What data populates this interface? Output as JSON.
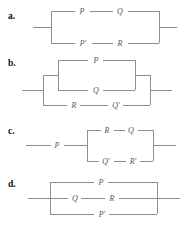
{
  "figure": {
    "line_color": "#8b8f94",
    "label_color": "#55585c",
    "marker_color": "#111111",
    "background": "#ffffff"
  },
  "panels": [
    {
      "marker": "a.",
      "topology": "parallel",
      "branches": [
        {
          "elements": [
            "P",
            "Q"
          ]
        },
        {
          "elements": [
            "P'",
            "R"
          ]
        }
      ],
      "labels": {
        "top_left": "P",
        "top_right": "Q",
        "bottom_left": "P'",
        "bottom_right": "R"
      }
    },
    {
      "marker": "b.",
      "topology": "parallel-with-nested-parallel",
      "branches": [
        {
          "nested_parallel": [
            "P",
            "Q"
          ]
        },
        {
          "elements": [
            "R",
            "Q'"
          ]
        }
      ],
      "labels": {
        "inner_top": "P",
        "inner_bottom": "Q",
        "outer_bottom_left": "R",
        "outer_bottom_right": "Q'"
      }
    },
    {
      "marker": "c.",
      "topology": "series-then-parallel",
      "series_element": "P",
      "branches": [
        {
          "elements": [
            "R",
            "Q"
          ]
        },
        {
          "elements": [
            "Q'",
            "R'"
          ]
        }
      ],
      "labels": {
        "lead": "P",
        "top_left": "R",
        "top_right": "Q",
        "bottom_left": "Q'",
        "bottom_right": "R'"
      }
    },
    {
      "marker": "d.",
      "topology": "three-branch-parallel",
      "branches": [
        {
          "elements": [
            "P"
          ]
        },
        {
          "elements": [
            "Q",
            "R"
          ]
        },
        {
          "elements": [
            "P'"
          ]
        }
      ],
      "labels": {
        "top": "P",
        "middle_left": "Q",
        "middle_right": "R",
        "bottom": "P'"
      }
    }
  ]
}
